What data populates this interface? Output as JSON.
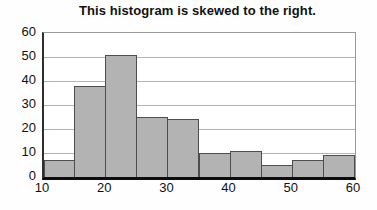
{
  "chart_data": {
    "type": "bar",
    "variant": "histogram",
    "title": "This histogram is skewed to the right.",
    "bin_edges": [
      10,
      15,
      20,
      25,
      30,
      35,
      40,
      45,
      50,
      55,
      60
    ],
    "categories": [
      "10-15",
      "15-20",
      "20-25",
      "25-30",
      "30-35",
      "35-40",
      "40-45",
      "45-50",
      "50-55",
      "55-60"
    ],
    "values": [
      7,
      38,
      51,
      25,
      24,
      10,
      11,
      5,
      7,
      9
    ],
    "xlabel": "",
    "ylabel": "",
    "x_ticks": [
      10,
      20,
      30,
      40,
      50,
      60
    ],
    "y_ticks": [
      0,
      10,
      20,
      30,
      40,
      50,
      60
    ],
    "xlim": [
      10,
      60
    ],
    "ylim": [
      0,
      60
    ],
    "grid": "horizontal",
    "legend": "none",
    "colors": {
      "bar_fill": "#b3b3b3",
      "bar_border": "#4d4d4d",
      "gridline": "#b4b4b4",
      "axis": "#0d0d0d",
      "background": "#ffffff",
      "text": "#111111"
    }
  }
}
